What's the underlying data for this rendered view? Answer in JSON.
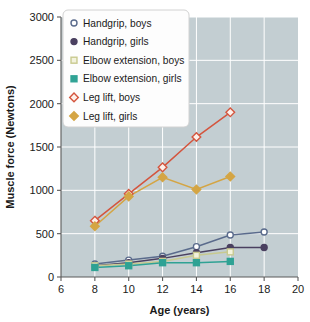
{
  "chart_data": {
    "type": "line",
    "title": "",
    "xlabel": "Age (years)",
    "ylabel": "Muscle force (Newtons)",
    "xlim": [
      6,
      20
    ],
    "ylim": [
      0,
      3000
    ],
    "xticks": [
      6,
      8,
      10,
      12,
      14,
      16,
      18,
      20
    ],
    "yticks": [
      0,
      500,
      1000,
      1500,
      2000,
      2500,
      3000
    ],
    "xtick_labels": [
      "6",
      "8",
      "10",
      "12",
      "14",
      "16",
      "18",
      "20"
    ],
    "ytick_labels": [
      "0",
      "500",
      "1000",
      "1500",
      "2000",
      "2500",
      "3000"
    ],
    "grid": true,
    "grid_color": "#ffffff",
    "plot_background": "#c3ced2",
    "figure_background": "#ffffff",
    "legend_position": "upper left",
    "series": [
      {
        "name": "Handgrip, boys",
        "marker": "open-circle",
        "color": "#5a6b8c",
        "fill": "none",
        "x": [
          8,
          10,
          12,
          14,
          16,
          18
        ],
        "values": [
          150,
          195,
          240,
          350,
          485,
          520
        ]
      },
      {
        "name": "Handgrip, girls",
        "marker": "filled-circle",
        "color": "#4a4060",
        "fill": "#4a4060",
        "x": [
          8,
          10,
          12,
          14,
          16,
          18
        ],
        "values": [
          130,
          165,
          215,
          280,
          340,
          340
        ]
      },
      {
        "name": "Elbow extension, boys",
        "marker": "open-square",
        "color": "#c8c98f",
        "fill": "#f2f2dd",
        "x": [
          8,
          10,
          12,
          14,
          16
        ],
        "values": [
          130,
          150,
          180,
          250,
          290
        ]
      },
      {
        "name": "Elbow extension, girls",
        "marker": "filled-square",
        "color": "#2fa294",
        "fill": "#2fa294",
        "x": [
          8,
          10,
          12,
          14,
          16
        ],
        "values": [
          110,
          130,
          165,
          165,
          180
        ]
      },
      {
        "name": "Leg lift, boys",
        "marker": "open-diamond",
        "color": "#d4553e",
        "fill": "#fdf0ea",
        "x": [
          8,
          10,
          12,
          14,
          16
        ],
        "values": [
          650,
          960,
          1265,
          1615,
          1900
        ]
      },
      {
        "name": "Leg lift, girls",
        "marker": "filled-diamond",
        "color": "#d4a544",
        "fill": "#d4a544",
        "x": [
          8,
          10,
          12,
          14,
          16
        ],
        "values": [
          585,
          930,
          1150,
          1010,
          1160
        ]
      }
    ]
  }
}
